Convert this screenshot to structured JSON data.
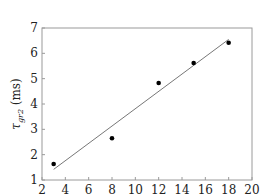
{
  "chart_data": {
    "type": "scatter",
    "title": "",
    "xlabel": "",
    "ylabel": "τ_gr2 (ms)",
    "ylabel_parts": {
      "symbol": "τ",
      "subscript": "gr2",
      "unit": " (ms)"
    },
    "xlim": [
      2,
      20
    ],
    "ylim": [
      1,
      7
    ],
    "xticks": [
      2,
      4,
      6,
      8,
      10,
      12,
      14,
      16,
      18,
      20
    ],
    "yticks": [
      1,
      2,
      3,
      4,
      5,
      6,
      7
    ],
    "grid": false,
    "legend": null,
    "series": [
      {
        "name": "measured",
        "kind": "scatter",
        "x": [
          3,
          8,
          12,
          15,
          18
        ],
        "y": [
          1.63,
          2.65,
          4.83,
          5.62,
          6.42
        ],
        "color": "#000000"
      },
      {
        "name": "linear fit",
        "kind": "line",
        "x": [
          3,
          18
        ],
        "y": [
          1.42,
          6.55
        ],
        "color": "#777777"
      }
    ]
  }
}
